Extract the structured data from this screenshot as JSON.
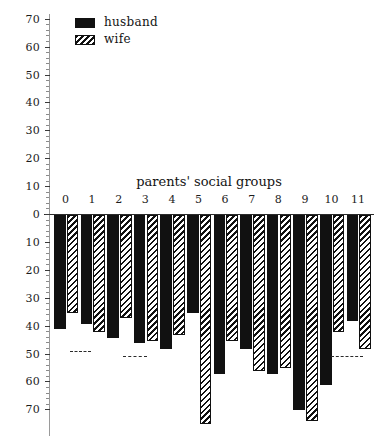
{
  "chart_data": {
    "type": "bar",
    "title": "parents' social groups",
    "orientation": "downward",
    "xlabel": "",
    "ylabel": "",
    "grid": false,
    "legend_position": "top-left",
    "categories": [
      "0",
      "1",
      "2",
      "3",
      "4",
      "5",
      "6",
      "7",
      "8",
      "9",
      "10",
      "11"
    ],
    "ytick_labels_upper": [
      "70",
      "60",
      "50",
      "40",
      "30",
      "20",
      "10",
      "0"
    ],
    "ytick_labels_lower": [
      "10",
      "20",
      "30",
      "40",
      "50",
      "60",
      "70"
    ],
    "ylim": [
      -70,
      70
    ],
    "ytick_step": 10,
    "series": [
      {
        "name": "husband",
        "fill": "solid-black",
        "color": "#111111",
        "values": [
          41,
          39,
          44,
          46,
          48,
          35,
          57,
          48,
          57,
          70,
          61,
          38
        ]
      },
      {
        "name": "wife",
        "fill": "diagonal-hatch",
        "color": "#111111",
        "values": [
          35,
          42,
          37,
          45,
          43,
          75,
          45,
          56,
          55,
          74,
          42,
          48
        ]
      }
    ],
    "reference_lines": [
      {
        "name": "husband-mean",
        "value": 49,
        "style": "dashed",
        "x_start": 0.6,
        "x_end": 1.4
      },
      {
        "name": "wife-mean",
        "value": 51,
        "style": "dashed",
        "x_start": 2.6,
        "x_end": 3.5
      },
      {
        "name": "right-mean",
        "value": 51,
        "style": "dashed",
        "x_start": 10.4,
        "x_end": 11.6
      }
    ]
  },
  "legend": {
    "items": [
      {
        "label": "husband",
        "swatch": "solid-black-swatch"
      },
      {
        "label": "wife",
        "swatch": "hatched-swatch"
      }
    ]
  }
}
